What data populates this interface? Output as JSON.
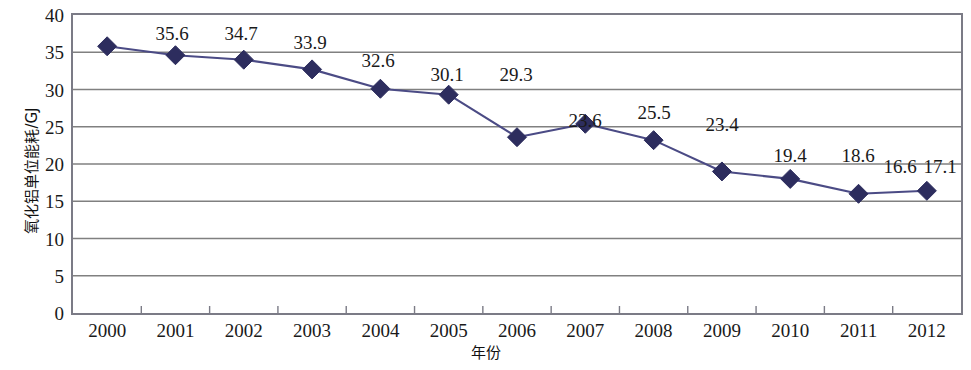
{
  "chart_data": {
    "type": "line",
    "title": "",
    "subtitle": "",
    "xlabel": "年份",
    "ylabel": "氧化铝单位能耗/GJ",
    "categories": [
      "2000",
      "2001",
      "2002",
      "2003",
      "2004",
      "2005",
      "2006",
      "2007",
      "2008",
      "2009",
      "2010",
      "2011",
      "2012"
    ],
    "values": [
      35.8,
      34.6,
      34.0,
      32.7,
      30.1,
      29.3,
      23.6,
      25.4,
      23.2,
      19.0,
      18.0,
      16.0,
      16.4
    ],
    "point_labels": [
      "",
      "35.6",
      "34.7",
      "33.9",
      "32.6",
      "30.1",
      "29.3",
      "23.6",
      "25.5",
      "23.4",
      "19.4",
      "18.6",
      "16.6",
      "17.1"
    ],
    "data_labels": [
      {
        "text": "35.6",
        "x_px": 172,
        "y_px": 33
      },
      {
        "text": "34.7",
        "x_px": 241,
        "y_px": 33
      },
      {
        "text": "33.9",
        "x_px": 310,
        "y_px": 42
      },
      {
        "text": "32.6",
        "x_px": 378,
        "y_px": 60
      },
      {
        "text": "30.1",
        "x_px": 447,
        "y_px": 74
      },
      {
        "text": "29.3",
        "x_px": 516,
        "y_px": 74
      },
      {
        "text": "23.6",
        "x_px": 585,
        "y_px": 120
      },
      {
        "text": "25.5",
        "x_px": 654,
        "y_px": 112
      },
      {
        "text": "23.4",
        "x_px": 722,
        "y_px": 124
      },
      {
        "text": "19.4",
        "x_px": 790,
        "y_px": 155
      },
      {
        "text": "18.6",
        "x_px": 858,
        "y_px": 155
      },
      {
        "text": "16.6",
        "x_px": 900,
        "y_px": 166
      },
      {
        "text": "17.1",
        "x_px": 940,
        "y_px": 166
      }
    ],
    "ylim": [
      0,
      40
    ],
    "ytick_step": 5,
    "yticks": [
      "40",
      "35",
      "30",
      "25",
      "20",
      "15",
      "10",
      "5",
      "0"
    ],
    "grid": "horizontal",
    "legend": "none",
    "series_name": "氧化铝单位能耗",
    "marker": "diamond",
    "colors": {
      "line": "#4b4b85",
      "marker": "#2d2d5e",
      "gridline": "#808080",
      "frame": "#7b7b86",
      "text": "#1a1a1a",
      "background": "#ffffff"
    }
  }
}
